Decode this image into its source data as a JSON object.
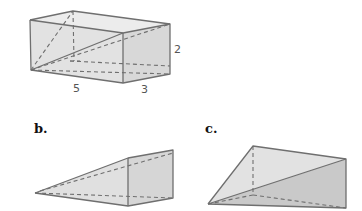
{
  "figures": [
    {
      "id": "a",
      "label": "",
      "shape": "rectangular prism with diagonal cut",
      "dimensions": {
        "length": "5",
        "width": "3",
        "height": "2"
      }
    },
    {
      "id": "b",
      "label": "b.",
      "shape": "triangular prism (wedge)"
    },
    {
      "id": "c",
      "label": "c.",
      "shape": "pyramid-like solid"
    }
  ],
  "colors": {
    "edge": "#6f6f6f",
    "face_light": "#e4e4e4",
    "face_mid": "#d6d6d6",
    "face_dark": "#c4c4c4"
  }
}
